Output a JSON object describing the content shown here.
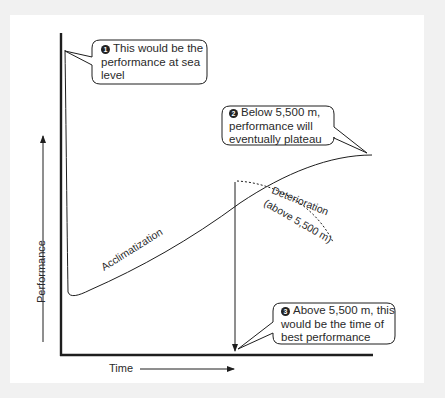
{
  "diagram": {
    "axes": {
      "y_label": "Performance",
      "x_label": "Time"
    },
    "curve_labels": {
      "acclimatization": "Acclimatization",
      "deterioration_line1": "Deterioration",
      "deterioration_line2": "(above 5,500 m)"
    },
    "callouts": [
      {
        "number": "1",
        "lines": [
          "This would be the",
          "performance at sea",
          "level"
        ]
      },
      {
        "number": "2",
        "lines": [
          "Below 5,500 m,",
          "performance will",
          "eventually plateau"
        ]
      },
      {
        "number": "3",
        "lines": [
          "Above 5,500 m, this",
          "would be the time of",
          "best performance"
        ]
      }
    ],
    "colors": {
      "background": "#f1f1f1",
      "panel": "#ffffff",
      "line": "#1e1e1e",
      "text": "#2a2a2a"
    }
  }
}
